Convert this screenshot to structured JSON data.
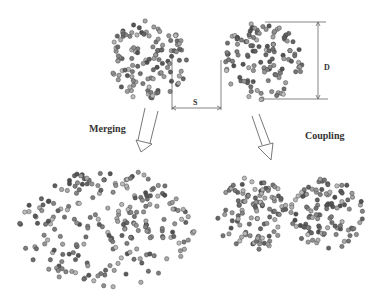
{
  "diagram": {
    "labels": {
      "merging": "Merging",
      "coupling": "Coupling",
      "spacing": "S",
      "diameter": "D"
    },
    "clusters": [
      {
        "id": "top-left",
        "cx": 148,
        "cy": 60,
        "rx": 40,
        "ry": 40,
        "count": 120
      },
      {
        "id": "top-right",
        "cx": 262,
        "cy": 62,
        "rx": 40,
        "ry": 40,
        "count": 120
      },
      {
        "id": "merged",
        "cx": 107,
        "cy": 228,
        "rx": 88,
        "ry": 60,
        "count": 230
      },
      {
        "id": "coupled-left",
        "cx": 252,
        "cy": 214,
        "rx": 37,
        "ry": 37,
        "count": 110
      },
      {
        "id": "coupled-right",
        "cx": 327,
        "cy": 214,
        "rx": 37,
        "ry": 37,
        "count": 110
      }
    ],
    "colors": {
      "particle_dark": "#444444",
      "particle_light": "#aaaaaa",
      "line": "#555555"
    }
  }
}
